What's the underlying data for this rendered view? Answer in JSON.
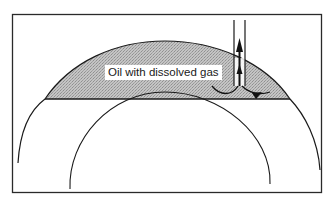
{
  "diagram": {
    "type": "geologic-cross-section",
    "label": "Oil with dissolved gas",
    "colors": {
      "frame": "#2a2a2a",
      "line": "#1a1a1a",
      "oil_zone_fill": "#bdbdbd",
      "oil_zone_stipple": "#9a9a9a",
      "background": "#ffffff"
    },
    "elements": [
      {
        "name": "frame",
        "description": "rectangular border"
      },
      {
        "name": "outer-arc",
        "description": "upper boundary of reservoir / cap rock"
      },
      {
        "name": "inner-arc",
        "description": "lower strata arc"
      },
      {
        "name": "oil-water-contact",
        "description": "horizontal line bounding oil zone"
      },
      {
        "name": "oil-zone",
        "description": "stippled gray region above contact line"
      },
      {
        "name": "well-pipe",
        "description": "vertical pipe from surface into oil zone"
      },
      {
        "name": "up-arrow",
        "description": "arrow showing upward flow in well"
      },
      {
        "name": "flow-arrows",
        "description": "curved arrows showing oil flowing into well bottom"
      }
    ]
  }
}
